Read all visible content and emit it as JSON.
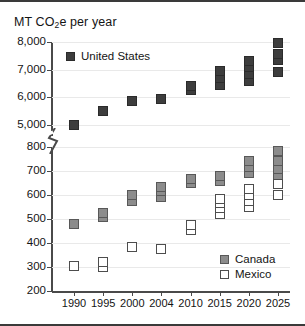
{
  "chart_data": {
    "type": "scatter",
    "title": "MT CO2e per year",
    "title_prefix": "MT CO",
    "title_sub": "2",
    "title_suffix": "e per year",
    "xlabel": "",
    "ylabel": "MT CO2e per year",
    "grid": true,
    "broken_axis": true,
    "categories": [
      "1990",
      "1995",
      "2000",
      "2004",
      "2010",
      "2015",
      "2020",
      "2025"
    ],
    "axis_top": {
      "ticks": [
        "5,000",
        "6,000",
        "7,000",
        "8,000"
      ],
      "tick_values": [
        5000,
        6000,
        7000,
        8000
      ],
      "ylim": [
        4600,
        8000
      ]
    },
    "axis_bottom": {
      "ticks": [
        "200",
        "300",
        "400",
        "500",
        "600",
        "700",
        "800"
      ],
      "tick_values": [
        200,
        300,
        400,
        500,
        600,
        700,
        800
      ],
      "ylim": [
        200,
        800
      ]
    },
    "series": [
      {
        "name": "United States",
        "panel": "top",
        "marker": "filled-dark",
        "color": "#3d3d3d",
        "points": [
          {
            "x": "1990",
            "values": [
              5000
            ]
          },
          {
            "x": "1995",
            "values": [
              5500
            ]
          },
          {
            "x": "2000",
            "values": [
              5850
            ]
          },
          {
            "x": "2004",
            "values": [
              5950
            ]
          },
          {
            "x": "2010",
            "values": [
              6250,
              6400
            ]
          },
          {
            "x": "2015",
            "values": [
              6450,
              6700,
              6950
            ]
          },
          {
            "x": "2020",
            "values": [
              6600,
              6850,
              7100,
              7300
            ]
          },
          {
            "x": "2025",
            "values": [
              6900,
              7350,
              7550,
              7950
            ]
          }
        ]
      },
      {
        "name": "Canada",
        "panel": "bottom",
        "marker": "filled-gray",
        "color": "#8c8c8c",
        "points": [
          {
            "x": "1990",
            "values": [
              480
            ]
          },
          {
            "x": "1995",
            "values": [
              510,
              525
            ]
          },
          {
            "x": "2000",
            "values": [
              575,
              600
            ]
          },
          {
            "x": "2004",
            "values": [
              590,
              615,
              635
            ]
          },
          {
            "x": "2010",
            "values": [
              650,
              665
            ]
          },
          {
            "x": "2015",
            "values": [
              660,
              680
            ]
          },
          {
            "x": "2020",
            "values": [
              690,
              715,
              740
            ]
          },
          {
            "x": "2025",
            "values": [
              685,
              710,
              740,
              785
            ]
          }
        ]
      },
      {
        "name": "Mexico",
        "panel": "bottom",
        "marker": "open",
        "color": "#ffffff",
        "points": [
          {
            "x": "1990",
            "values": [
              305
            ]
          },
          {
            "x": "1995",
            "values": [
              300,
              320
            ]
          },
          {
            "x": "2000",
            "values": [
              385
            ]
          },
          {
            "x": "2004",
            "values": [
              375
            ]
          },
          {
            "x": "2010",
            "values": [
              455,
              475
            ]
          },
          {
            "x": "2015",
            "values": [
              520,
              545,
              565,
              585
            ]
          },
          {
            "x": "2020",
            "values": [
              550,
              575,
              600,
              625
            ]
          },
          {
            "x": "2025",
            "values": [
              600,
              645
            ]
          }
        ]
      }
    ],
    "legend": {
      "position": "inside",
      "entries": [
        {
          "label": "United States",
          "marker": "filled-dark"
        },
        {
          "label": "Canada",
          "marker": "filled-gray"
        },
        {
          "label": "Mexico",
          "marker": "open"
        }
      ]
    }
  },
  "colors": {
    "us": "#3d3d3d",
    "canada": "#8c8c8c",
    "mexico": "#ffffff",
    "axis": "#4a4a4a",
    "grid": "#e9e9e9",
    "frame": "#3a3a3a",
    "text": "#141414"
  }
}
